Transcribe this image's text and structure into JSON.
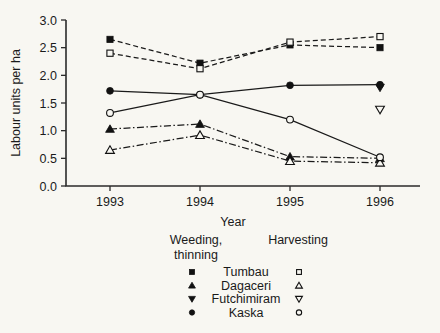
{
  "chart_data": {
    "type": "line",
    "title": "",
    "xlabel": "Year",
    "ylabel": "Labour units per ha",
    "categories": [
      "1993",
      "1994",
      "1995",
      "1996"
    ],
    "x": [
      1993,
      1994,
      1995,
      1996
    ],
    "ylim": [
      0.0,
      3.0
    ],
    "yticks": [
      "0.0",
      "0.5",
      "1.0",
      "1.5",
      "2.0",
      "2.5",
      "3.0"
    ],
    "ytick_values": [
      0.0,
      0.5,
      1.0,
      1.5,
      2.0,
      2.5,
      3.0
    ],
    "grid": false,
    "legend_position": "below-plot",
    "legend_groups": [
      "Weeding, thinning",
      "Harvesting"
    ],
    "legend_group_lines": [
      [
        "Weeding,",
        "thinning"
      ],
      [
        "Harvesting"
      ]
    ],
    "series": [
      {
        "name": "Tumbau",
        "group": "Weeding, thinning",
        "marker": "square-filled",
        "line": "dashed",
        "values": [
          2.65,
          2.22,
          2.55,
          2.5
        ]
      },
      {
        "name": "Tumbau",
        "group": "Harvesting",
        "marker": "square-open",
        "line": "dashed",
        "values": [
          2.4,
          2.12,
          2.6,
          2.7
        ]
      },
      {
        "name": "Dagaceri",
        "group": "Weeding, thinning",
        "marker": "triangle-up-filled",
        "line": "dashdot",
        "values": [
          1.03,
          1.12,
          0.53,
          0.5
        ]
      },
      {
        "name": "Dagaceri",
        "group": "Harvesting",
        "marker": "triangle-up-open",
        "line": "dashdot",
        "values": [
          0.65,
          0.92,
          0.45,
          0.42
        ]
      },
      {
        "name": "Futchimiram",
        "group": "Weeding, thinning",
        "marker": "triangle-down-filled",
        "line": "none",
        "values": [
          null,
          null,
          null,
          1.78
        ]
      },
      {
        "name": "Futchimiram",
        "group": "Harvesting",
        "marker": "triangle-down-open",
        "line": "none",
        "values": [
          null,
          null,
          null,
          1.38
        ]
      },
      {
        "name": "Kaska",
        "group": "Weeding, thinning",
        "marker": "circle-filled",
        "line": "solid",
        "values": [
          1.72,
          1.65,
          1.82,
          1.83
        ]
      },
      {
        "name": "Kaska",
        "group": "Harvesting",
        "marker": "circle-open",
        "line": "solid",
        "values": [
          1.32,
          1.65,
          1.2,
          0.52
        ]
      }
    ],
    "legend_entries": [
      {
        "label": "Tumbau",
        "filled_marker": "square-filled",
        "open_marker": "square-open"
      },
      {
        "label": "Dagaceri",
        "filled_marker": "triangle-up-filled",
        "open_marker": "triangle-up-open"
      },
      {
        "label": "Futchimiram",
        "filled_marker": "triangle-down-filled",
        "open_marker": "triangle-down-open"
      },
      {
        "label": "Kaska",
        "filled_marker": "circle-filled",
        "open_marker": "circle-open"
      }
    ],
    "colors": {
      "ink": "#1a1a1a",
      "background": "#f8f7f2"
    }
  }
}
